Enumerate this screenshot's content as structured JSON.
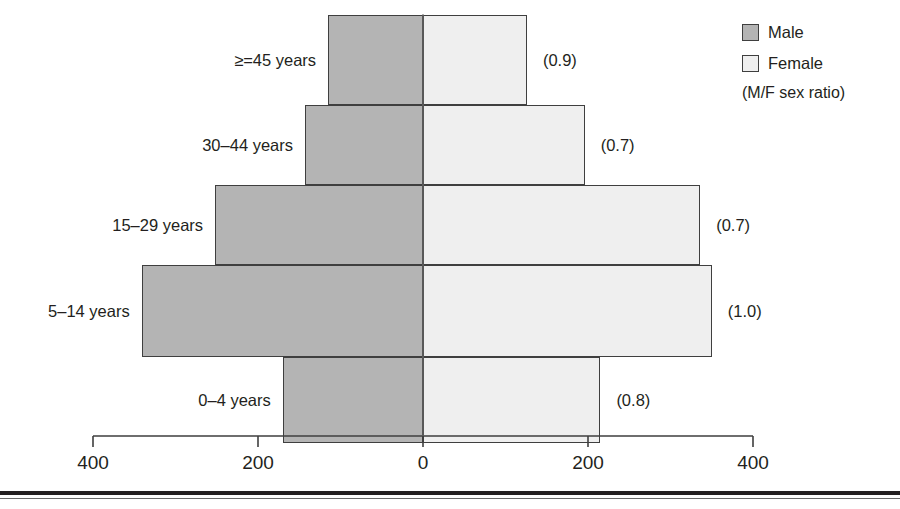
{
  "chart_data": {
    "type": "bar",
    "subtype": "population-pyramid",
    "title": "",
    "xlabel": "",
    "ylabel": "",
    "orientation": "horizontal-diverging",
    "categories": [
      "0–4 years",
      "5–14 years",
      "15–29 years",
      "30–44 years",
      "≥=45 years"
    ],
    "series": [
      {
        "name": "Male",
        "color": "#b4b4b4",
        "values": [
          170,
          341,
          252,
          143,
          115
        ]
      },
      {
        "name": "Female",
        "color": "#efefef",
        "values": [
          215,
          350,
          336,
          196,
          126
        ]
      }
    ],
    "annotations": {
      "label": "(M/F sex ratio)",
      "values": [
        "(0.8)",
        "(1.0)",
        "(0.7)",
        "(0.7)",
        "(0.9)"
      ]
    },
    "axis": {
      "ticks": [
        -400,
        -200,
        0,
        200,
        400
      ],
      "tick_labels": [
        "400",
        "200",
        "0",
        "200",
        "400"
      ],
      "xlim": [
        -400,
        400
      ],
      "grid": false
    },
    "legend": {
      "position": "top-right",
      "entries": [
        "Male",
        "Female"
      ],
      "note": "(M/F sex ratio)"
    }
  },
  "rows": [
    {
      "label": "≥=45 years",
      "male": 115,
      "female": 126,
      "ratio": "(0.9)"
    },
    {
      "label": "30–44 years",
      "male": 143,
      "female": 196,
      "ratio": "(0.7)"
    },
    {
      "label": "15–29 years",
      "male": 252,
      "female": 336,
      "ratio": "(0.7)"
    },
    {
      "label": "5–14 years",
      "male": 341,
      "female": 350,
      "ratio": "(1.0)"
    },
    {
      "label": "0–4 years",
      "male": 170,
      "female": 215,
      "ratio": "(0.8)"
    }
  ],
  "axis": {
    "tick_labels": [
      "400",
      "200",
      "0",
      "200",
      "400"
    ]
  },
  "legend": {
    "male_label": "Male",
    "female_label": "Female",
    "note": "(M/F sex ratio)"
  },
  "colors": {
    "male": "#b4b4b4",
    "female": "#efefef",
    "outline": "#3f3f3f",
    "text": "#231f20"
  }
}
